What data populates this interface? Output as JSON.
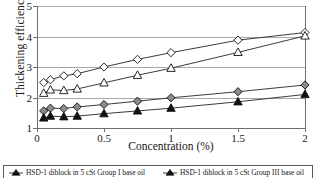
{
  "chart_data": {
    "type": "line",
    "title": "",
    "xlabel": "Concentration (%)",
    "ylabel": "Thickening efficiency (TE)",
    "xlim": [
      0,
      2
    ],
    "ylim": [
      1,
      5
    ],
    "xticks": [
      "0",
      "0.5",
      "1",
      "1.5",
      "2"
    ],
    "xtick_values": [
      0,
      0.5,
      1,
      1.5,
      2
    ],
    "yticks": [
      "1",
      "2",
      "3",
      "4",
      "5"
    ],
    "ytick_values": [
      1,
      2,
      3,
      4,
      5
    ],
    "grid": "horizontal",
    "legend_position": "bottom",
    "x": [
      0.05,
      0.1,
      0.2,
      0.3,
      0.5,
      0.75,
      1.0,
      1.5,
      2.0
    ],
    "series": [
      {
        "name": "open-diamond",
        "marker": "open-diamond",
        "values": [
          2.49,
          2.58,
          2.71,
          2.78,
          3.0,
          3.25,
          3.47,
          3.88,
          4.13
        ]
      },
      {
        "name": "open-triangle",
        "marker": "open-triangle",
        "values": [
          2.14,
          2.25,
          2.23,
          2.28,
          2.48,
          2.73,
          2.96,
          3.48,
          4.02
        ]
      },
      {
        "name": "filled-diamond",
        "marker": "filled-diamond",
        "values": [
          1.56,
          1.65,
          1.64,
          1.69,
          1.77,
          1.88,
          1.99,
          2.19,
          2.41
        ]
      },
      {
        "name": "filled-triangle",
        "marker": "filled-triangle",
        "values": [
          1.33,
          1.39,
          1.37,
          1.39,
          1.47,
          1.56,
          1.65,
          1.86,
          2.1
        ]
      }
    ]
  },
  "legend": {
    "items": [
      {
        "label": "HSD-1 diblock in 5 cSt Group I base oil",
        "marker": "filled-triangle"
      },
      {
        "label": "HSD-1 diblock in 5 cSt Group III base oil",
        "marker": "filled-triangle"
      }
    ]
  },
  "colors": {
    "line": "#3a3a3a",
    "grid": "#a8a8a8",
    "axis": "#6e6e6e",
    "marker_fill_dark": "#111111",
    "marker_fill_gray": "#8c8c8c",
    "marker_open": "#ffffff",
    "text": "#161616"
  }
}
